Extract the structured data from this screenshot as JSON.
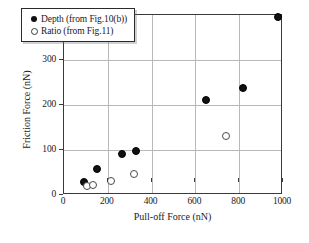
{
  "chart_data": {
    "type": "scatter",
    "title": "",
    "xlabel": "Pull-off Force (nN)",
    "ylabel": "Friction Force (nN)",
    "xlim": [
      0,
      1000
    ],
    "ylim": [
      0,
      400
    ],
    "xticks": [
      "0",
      "200",
      "400",
      "600",
      "800",
      "1000"
    ],
    "xtick_values": [
      0,
      200,
      400,
      600,
      800,
      1000
    ],
    "yticks": [
      "0",
      "100",
      "200",
      "300",
      "400"
    ],
    "ytick_values": [
      0,
      100,
      200,
      300,
      400
    ],
    "grid": true,
    "legend_position": "upper-left",
    "series": [
      {
        "name": "Depth (from Fig.10(b))",
        "marker": "filled-circle",
        "color": "#111111",
        "points": [
          {
            "x": 90,
            "y": 29
          },
          {
            "x": 150,
            "y": 57
          },
          {
            "x": 263,
            "y": 91
          },
          {
            "x": 330,
            "y": 97
          },
          {
            "x": 650,
            "y": 211
          },
          {
            "x": 816,
            "y": 237
          },
          {
            "x": 975,
            "y": 395
          }
        ]
      },
      {
        "name": "Ratio (from Fig.11)",
        "marker": "open-circle",
        "color": "#4a4a4a",
        "points": [
          {
            "x": 103,
            "y": 21
          },
          {
            "x": 133,
            "y": 23
          },
          {
            "x": 216,
            "y": 32
          },
          {
            "x": 320,
            "y": 46
          },
          {
            "x": 742,
            "y": 131
          }
        ]
      }
    ]
  },
  "legend": {
    "items": [
      {
        "label": "Depth (from Fig.10(b))",
        "marker": "filled-circle"
      },
      {
        "label": "Ratio (from Fig.11)",
        "marker": "open-circle"
      }
    ]
  }
}
